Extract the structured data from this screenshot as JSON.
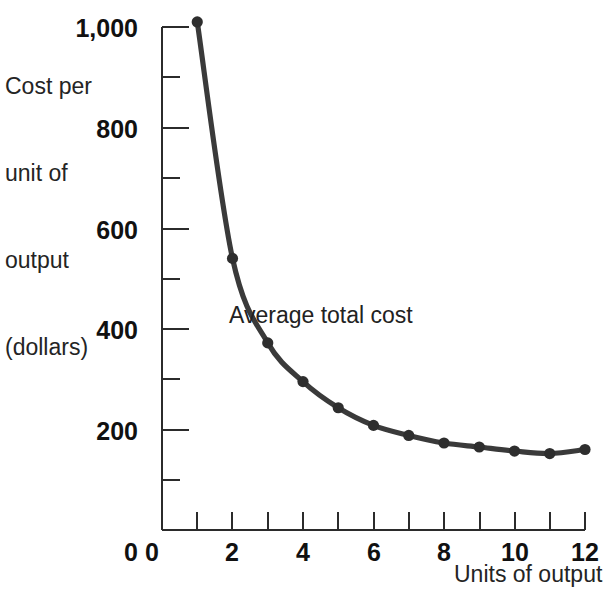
{
  "chart_data": {
    "type": "line",
    "title": "",
    "subtitle": "",
    "xlabel": "Units of output",
    "ylabel": "Cost per\nunit of\noutput\n(dollars)",
    "ylabel_lines": [
      "Cost per",
      "unit of",
      "output",
      "(dollars)"
    ],
    "x": [
      1,
      2,
      3,
      4,
      5,
      6,
      7,
      8,
      9,
      10,
      11,
      12
    ],
    "values": [
      1010,
      540,
      372,
      295,
      243,
      208,
      188,
      173,
      165,
      157,
      152,
      160
    ],
    "series": [
      {
        "name": "Average total cost",
        "x": [
          1,
          2,
          3,
          4,
          5,
          6,
          7,
          8,
          9,
          10,
          11,
          12
        ],
        "values": [
          1010,
          540,
          372,
          295,
          243,
          208,
          188,
          173,
          165,
          157,
          152,
          160
        ]
      }
    ],
    "annotations": [
      {
        "text": "Average total cost",
        "x": 3.95,
        "y": 452
      }
    ],
    "xlim": [
      0,
      12
    ],
    "ylim": [
      0,
      1000
    ],
    "x_ticks_major": [
      0,
      2,
      4,
      6,
      8,
      10,
      12
    ],
    "x_ticks_all": [
      0,
      1,
      2,
      3,
      4,
      5,
      6,
      7,
      8,
      9,
      10,
      11,
      12
    ],
    "x_tick_labels": [
      "0",
      "2",
      "4",
      "6",
      "8",
      "10",
      "12"
    ],
    "y_ticks_major": [
      0,
      200,
      400,
      600,
      800,
      1000
    ],
    "y_ticks_minor": [
      100,
      300,
      500,
      700,
      900
    ],
    "y_tick_labels": [
      "0",
      "200",
      "400",
      "600",
      "800",
      "1,000"
    ],
    "grid": false,
    "legend": "none",
    "line_color": "#3a3a3a",
    "marker_color": "#2e2e2e",
    "axis_color": "#2b2b2b",
    "background_color": "#ffffff"
  },
  "labels": {
    "y_line_1": "Cost per",
    "y_line_2": "unit of",
    "y_line_3": "output",
    "y_line_4": "(dollars)",
    "x_axis_title": "Units of output",
    "series_annotation": "Average total cost",
    "y0": "0",
    "y200": "200",
    "y400": "400",
    "y600": "600",
    "y800": "800",
    "y1000": "1,000",
    "x0": "0",
    "x2": "2",
    "x4": "4",
    "x6": "6",
    "x8": "8",
    "x10": "10",
    "x12": "12"
  }
}
